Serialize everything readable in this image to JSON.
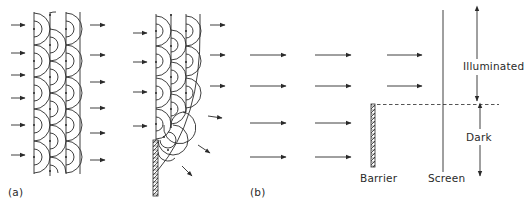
{
  "figure": {
    "panel_a": {
      "label": "(a)",
      "description": "Huygens wavelets propagating from successive wavefronts; left: unobstructed plane wave, right: wave passing edge of a barrier bending into shadow"
    },
    "panel_b": {
      "label": "(b)",
      "barrier_label": "Barrier",
      "screen_label": "Screen",
      "illuminated_label": "Illuminated",
      "dark_label": "Dark"
    },
    "colors": {
      "ink": "#2a2a2a",
      "background": "#ffffff"
    }
  }
}
